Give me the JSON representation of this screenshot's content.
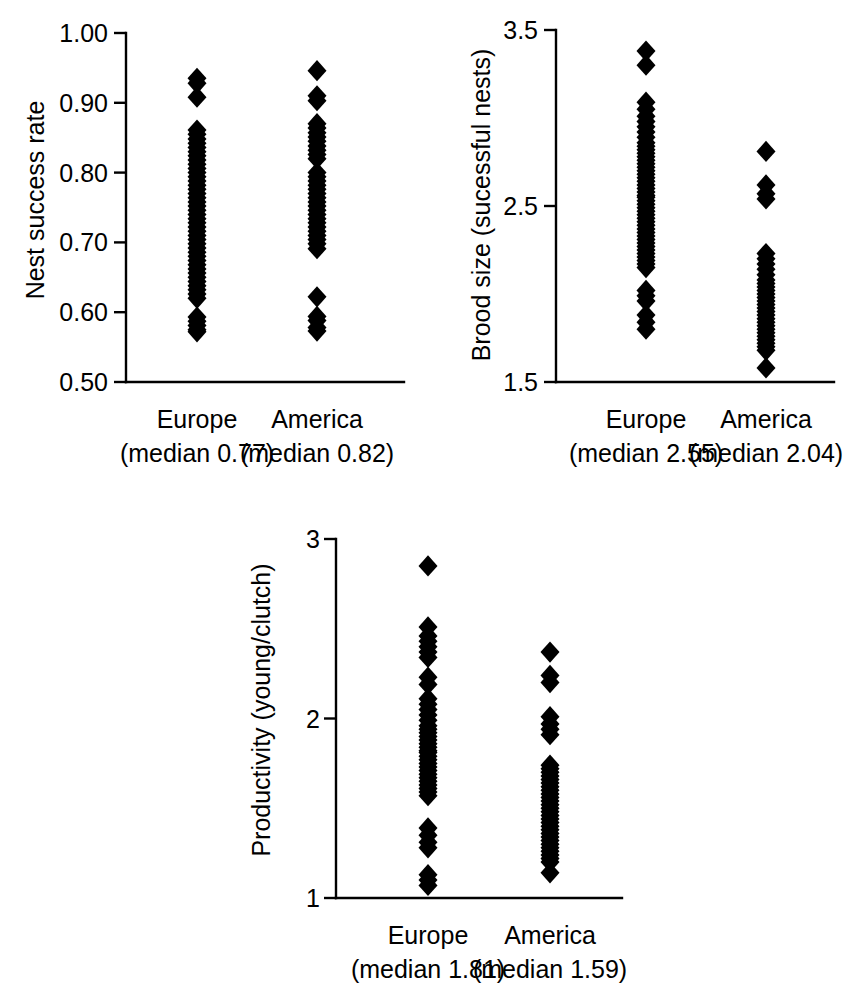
{
  "figure": {
    "title": "",
    "background": "#ffffff",
    "marker_color": "#000000",
    "panels": [
      "nest-success-rate",
      "brood-size",
      "productivity"
    ]
  },
  "chart_data": [
    {
      "id": "nest-success-rate",
      "type": "scatter",
      "subtype": "strip-plot",
      "title": "",
      "xlabel": "",
      "ylabel": "Nest success rate",
      "ylim": [
        0.5,
        1.0
      ],
      "yticks": [
        0.5,
        0.6,
        0.7,
        0.8,
        0.9,
        1.0
      ],
      "ytick_labels": [
        "0.50",
        "0.60",
        "0.70",
        "0.80",
        "0.90",
        "1.00"
      ],
      "grid": false,
      "legend": "none",
      "categories": [
        "Europe",
        "America"
      ],
      "medians": [
        0.77,
        0.82
      ],
      "median_labels": [
        "(median 0.77)",
        "(median 0.82)"
      ],
      "groups": [
        {
          "name": "Europe",
          "median": 0.77,
          "n": 52,
          "values": [
            0.935,
            0.928,
            0.908,
            0.861,
            0.855,
            0.848,
            0.842,
            0.836,
            0.83,
            0.824,
            0.818,
            0.812,
            0.806,
            0.8,
            0.794,
            0.788,
            0.782,
            0.776,
            0.77,
            0.764,
            0.758,
            0.752,
            0.746,
            0.74,
            0.734,
            0.728,
            0.722,
            0.716,
            0.71,
            0.704,
            0.698,
            0.692,
            0.686,
            0.68,
            0.674,
            0.668,
            0.662,
            0.656,
            0.65,
            0.644,
            0.638,
            0.632,
            0.626,
            0.62,
            0.593,
            0.587,
            0.581,
            0.575,
            0.572
          ]
        },
        {
          "name": "America",
          "median": 0.82,
          "n": 33,
          "values": [
            0.946,
            0.91,
            0.903,
            0.87,
            0.864,
            0.857,
            0.851,
            0.845,
            0.838,
            0.832,
            0.826,
            0.82,
            0.8,
            0.794,
            0.788,
            0.782,
            0.776,
            0.77,
            0.764,
            0.758,
            0.752,
            0.746,
            0.74,
            0.734,
            0.728,
            0.722,
            0.716,
            0.71,
            0.704,
            0.698,
            0.691,
            0.622,
            0.594,
            0.588,
            0.578,
            0.573
          ]
        }
      ]
    },
    {
      "id": "brood-size",
      "type": "scatter",
      "subtype": "strip-plot",
      "title": "",
      "xlabel": "",
      "ylabel": "Brood size (sucessful nests)",
      "ylim": [
        1.5,
        3.5
      ],
      "yticks": [
        1.5,
        2.5,
        3.5
      ],
      "ytick_labels": [
        "1.5",
        "2.5",
        "3.5"
      ],
      "grid": false,
      "legend": "none",
      "categories": [
        "Europe",
        "America"
      ],
      "medians": [
        2.55,
        2.04
      ],
      "median_labels": [
        "(median 2.55)",
        "(median 2.04)"
      ],
      "groups": [
        {
          "name": "Europe",
          "median": 2.55,
          "n": 60,
          "values": [
            3.38,
            3.3,
            3.09,
            3.05,
            3.01,
            2.98,
            2.95,
            2.92,
            2.89,
            2.86,
            2.84,
            2.82,
            2.8,
            2.78,
            2.76,
            2.74,
            2.72,
            2.7,
            2.68,
            2.66,
            2.64,
            2.62,
            2.6,
            2.58,
            2.56,
            2.55,
            2.53,
            2.51,
            2.49,
            2.47,
            2.45,
            2.43,
            2.41,
            2.39,
            2.37,
            2.35,
            2.33,
            2.31,
            2.29,
            2.27,
            2.25,
            2.23,
            2.21,
            2.19,
            2.17,
            2.15,
            2.02,
            1.99,
            1.96,
            1.88,
            1.84,
            1.8
          ]
        },
        {
          "name": "America",
          "median": 2.04,
          "n": 32,
          "values": [
            2.81,
            2.62,
            2.57,
            2.54,
            2.23,
            2.2,
            2.17,
            2.14,
            2.11,
            2.08,
            2.06,
            2.04,
            2.02,
            2.0,
            1.98,
            1.96,
            1.94,
            1.92,
            1.9,
            1.88,
            1.86,
            1.84,
            1.82,
            1.8,
            1.78,
            1.76,
            1.74,
            1.72,
            1.7,
            1.68,
            1.58
          ]
        }
      ]
    },
    {
      "id": "productivity",
      "type": "scatter",
      "subtype": "strip-plot",
      "title": "",
      "xlabel": "",
      "ylabel": "Productivity (young/clutch)",
      "ylim": [
        1,
        3
      ],
      "yticks": [
        1,
        2,
        3
      ],
      "ytick_labels": [
        "1",
        "2",
        "3"
      ],
      "grid": false,
      "legend": "none",
      "categories": [
        "Europe",
        "America"
      ],
      "medians": [
        1.81,
        1.59
      ],
      "median_labels": [
        "(median 1.81)",
        "(median 1.59)"
      ],
      "groups": [
        {
          "name": "Europe",
          "median": 1.81,
          "n": 54,
          "values": [
            2.85,
            2.51,
            2.46,
            2.43,
            2.4,
            2.37,
            2.34,
            2.23,
            2.19,
            2.11,
            2.08,
            2.05,
            2.02,
            1.99,
            1.96,
            1.94,
            1.92,
            1.9,
            1.88,
            1.86,
            1.84,
            1.82,
            1.81,
            1.79,
            1.77,
            1.75,
            1.73,
            1.71,
            1.69,
            1.67,
            1.65,
            1.63,
            1.61,
            1.59,
            1.57,
            1.39,
            1.35,
            1.31,
            1.28,
            1.13,
            1.1,
            1.07
          ]
        },
        {
          "name": "America",
          "median": 1.59,
          "n": 35,
          "values": [
            2.37,
            2.24,
            2.2,
            2.01,
            1.97,
            1.94,
            1.91,
            1.74,
            1.72,
            1.7,
            1.68,
            1.66,
            1.64,
            1.62,
            1.6,
            1.58,
            1.56,
            1.54,
            1.52,
            1.5,
            1.48,
            1.46,
            1.44,
            1.42,
            1.4,
            1.38,
            1.36,
            1.34,
            1.32,
            1.3,
            1.28,
            1.26,
            1.24,
            1.22,
            1.2,
            1.14
          ]
        }
      ]
    }
  ]
}
